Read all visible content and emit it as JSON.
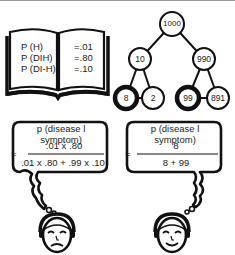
{
  "book": {
    "labels": [
      "P (H)",
      "P (DIH)",
      "P (DI-H)"
    ],
    "values": [
      "=.01",
      "=.80",
      "=.10"
    ]
  },
  "tree": {
    "root": "1000",
    "left": "10",
    "right": "990",
    "left_left": "8",
    "left_right": "2",
    "right_left": "99",
    "right_right": "891"
  },
  "bubble_left": {
    "title": "p (disease l symptom)",
    "equals": "=",
    "numerator": ".01 x .80",
    "denominator": ".01 x .80 + .99 x .10"
  },
  "bubble_right": {
    "title": "p (disease l symptom)",
    "equals": "=",
    "numerator": "8",
    "denominator": "8 + 99"
  },
  "faces": {
    "left": "frowning-face",
    "right": "smiling-face"
  }
}
